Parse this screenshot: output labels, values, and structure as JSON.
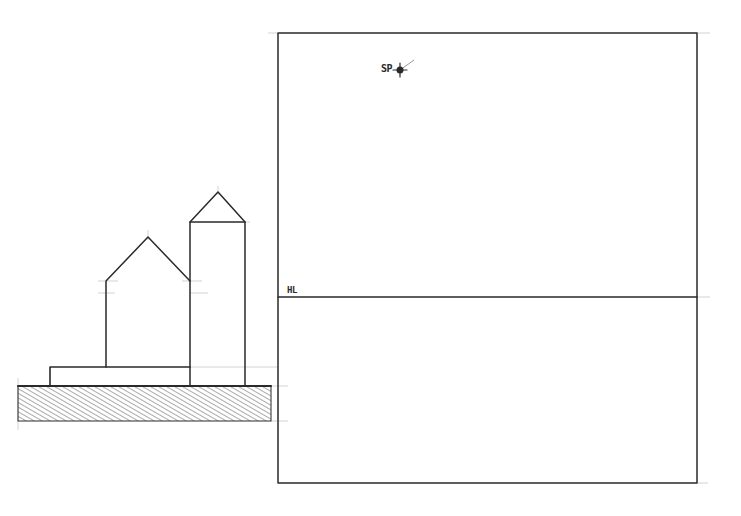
{
  "drawing": {
    "type": "perspective construction sketch",
    "labels": {
      "horizon_line": "HL",
      "station_point": "SP"
    },
    "colors": {
      "ink": "#2a2a2a",
      "construction": "#c8c8c8",
      "paper": "#ffffff"
    },
    "picture_plane": {
      "left": 278,
      "top": 33,
      "right": 697,
      "bottom": 483
    },
    "horizon_y": 297,
    "station_point": {
      "x": 400,
      "y": 70
    },
    "ground_section": {
      "left": 18,
      "top": 386,
      "right": 271,
      "bottom": 421,
      "fill": "diagonal-hatch"
    },
    "elevation": {
      "base_slab": {
        "left": 50,
        "top": 367,
        "right": 190,
        "bottom": 386
      },
      "house": {
        "left": 106,
        "right": 190,
        "eave_y": 281,
        "ridge": {
          "x": 148,
          "y": 237
        },
        "bottom": 367
      },
      "tower": {
        "left": 190,
        "right": 245,
        "eave_y": 222,
        "ridge": {
          "x": 218,
          "y": 192
        },
        "bottom": 386
      }
    }
  }
}
